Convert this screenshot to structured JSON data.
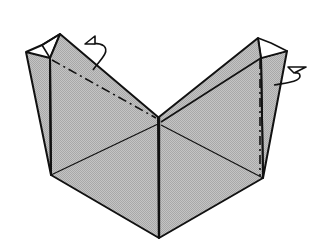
{
  "diagram": {
    "background": "#ffffff",
    "paper_fill": "#b8b8b8",
    "paper_fill_light": "#ffffff",
    "line_color": "#111111",
    "symbols": [
      {
        "name": "mountain-fold-line-left",
        "type": "dash-dot"
      },
      {
        "name": "mountain-fold-line-right",
        "type": "dash-dot"
      },
      {
        "name": "fold-behind-arrow-left",
        "type": "arrow"
      },
      {
        "name": "fold-behind-arrow-right",
        "type": "arrow"
      }
    ]
  }
}
